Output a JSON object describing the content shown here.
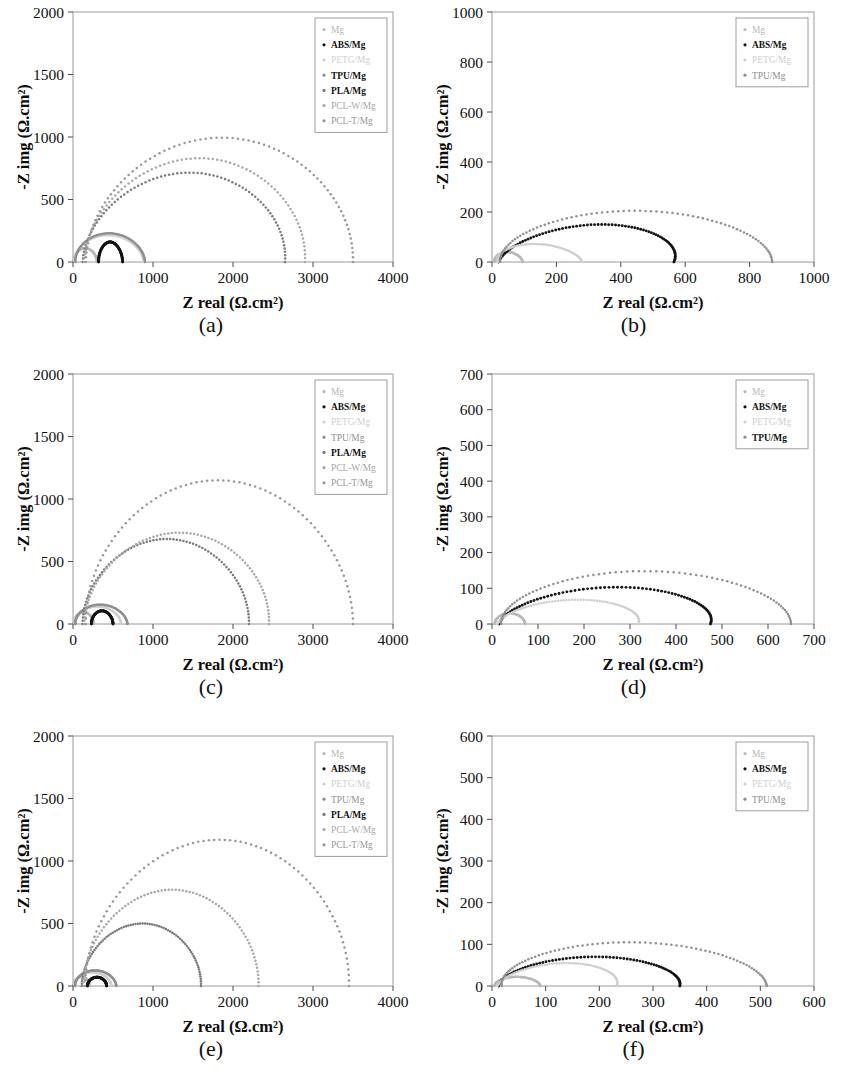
{
  "figure": {
    "axis_titles": {
      "x": "Z real (Ω.cm²)",
      "y": "-Z img (Ω.cm²)"
    },
    "series_colors": {
      "Mg": "#b9b9b9",
      "ABS/Mg": "#141414",
      "PETG/Mg": "#cfcfcf",
      "TPU/Mg": "#8f8f8f",
      "PLA/Mg": "#7a7a7a",
      "PCL-W/Mg": "#a8a8a8",
      "PCL-T/Mg": "#989898"
    }
  },
  "panels": [
    {
      "id": "a",
      "caption": "(a)",
      "legend": [
        "Mg",
        "ABS/Mg",
        "PETG/Mg",
        "TPU/Mg",
        "PLA/Mg",
        "PCL-W/Mg",
        "PCL-T/Mg"
      ],
      "legend_bold": [
        "ABS/Mg",
        "TPU/Mg",
        "PLA/Mg"
      ],
      "xticks": [
        0,
        1000,
        2000,
        3000,
        4000
      ],
      "yticks": [
        0,
        500,
        1000,
        1500,
        2000
      ]
    },
    {
      "id": "b",
      "caption": "(b)",
      "legend": [
        "Mg",
        "ABS/Mg",
        "PETG/Mg",
        "TPU/Mg"
      ],
      "legend_bold": [
        "ABS/Mg"
      ],
      "xticks": [
        0,
        200,
        400,
        600,
        800,
        1000
      ],
      "yticks": [
        0,
        200,
        400,
        600,
        800,
        1000
      ]
    },
    {
      "id": "c",
      "caption": "(c)",
      "legend": [
        "Mg",
        "ABS/Mg",
        "PETG/Mg",
        "TPU/Mg",
        "PLA/Mg",
        "PCL-W/Mg",
        "PCL-T/Mg"
      ],
      "legend_bold": [
        "ABS/Mg",
        "PLA/Mg"
      ],
      "xticks": [
        0,
        1000,
        2000,
        3000,
        4000
      ],
      "yticks": [
        0,
        500,
        1000,
        1500,
        2000
      ]
    },
    {
      "id": "d",
      "caption": "(d)",
      "legend": [
        "Mg",
        "ABS/Mg",
        "PETG/Mg",
        "TPU/Mg"
      ],
      "legend_bold": [
        "ABS/Mg",
        "TPU/Mg"
      ],
      "xticks": [
        0,
        100,
        200,
        300,
        400,
        500,
        600,
        700
      ],
      "yticks": [
        0,
        100,
        200,
        300,
        400,
        500,
        600,
        700
      ]
    },
    {
      "id": "e",
      "caption": "(e)",
      "legend": [
        "Mg",
        "ABS/Mg",
        "PETG/Mg",
        "TPU/Mg",
        "PLA/Mg",
        "PCL-W/Mg",
        "PCL-T/Mg"
      ],
      "legend_bold": [
        "ABS/Mg",
        "PLA/Mg"
      ],
      "xticks": [
        0,
        1000,
        2000,
        3000,
        4000
      ],
      "yticks": [
        0,
        500,
        1000,
        1500,
        2000
      ]
    },
    {
      "id": "f",
      "caption": "(f)",
      "legend": [
        "Mg",
        "ABS/Mg",
        "PETG/Mg",
        "TPU/Mg"
      ],
      "legend_bold": [
        "ABS/Mg"
      ],
      "xticks": [
        0,
        100,
        200,
        300,
        400,
        500,
        600
      ],
      "yticks": [
        0,
        100,
        200,
        300,
        400,
        500,
        600
      ]
    }
  ],
  "chart_data": [
    {
      "type": "scatter",
      "panel": "a",
      "title": "(a)",
      "xlabel": "Z real (Ω.cm²)",
      "ylabel": "-Z img (Ω.cm²)",
      "xlim": [
        0,
        4000
      ],
      "ylim": [
        0,
        2000
      ],
      "grid": false,
      "legend_position": "top-right",
      "series": [
        {
          "name": "Mg",
          "color": "#b9b9b9",
          "arc": {
            "x_start": 10,
            "x_end": 300,
            "peak_y": 110,
            "peak_x": 150
          }
        },
        {
          "name": "ABS/Mg",
          "color": "#141414",
          "arc": {
            "x_start": 320,
            "x_end": 620,
            "peak_y": 160,
            "peak_x": 460
          }
        },
        {
          "name": "PETG/Mg",
          "color": "#cfcfcf",
          "arc": {
            "x_start": 20,
            "x_end": 880,
            "peak_y": 215,
            "peak_x": 430
          }
        },
        {
          "name": "TPU/Mg",
          "color": "#8f8f8f",
          "arc": {
            "x_start": 30,
            "x_end": 900,
            "peak_y": 230,
            "peak_x": 440
          }
        },
        {
          "name": "PLA/Mg",
          "color": "#7a7a7a",
          "arc": {
            "x_start": 120,
            "x_end": 2650,
            "peak_y": 715,
            "peak_x": 1500
          }
        },
        {
          "name": "PCL-W/Mg",
          "color": "#a8a8a8",
          "arc": {
            "x_start": 140,
            "x_end": 2900,
            "peak_y": 830,
            "peak_x": 1620
          }
        },
        {
          "name": "PCL-T/Mg",
          "color": "#989898",
          "arc": {
            "x_start": 160,
            "x_end": 3500,
            "peak_y": 995,
            "peak_x": 1880
          }
        }
      ]
    },
    {
      "type": "scatter",
      "panel": "b",
      "title": "(b)",
      "xlabel": "Z real (Ω.cm²)",
      "ylabel": "-Z img (Ω.cm²)",
      "xlim": [
        0,
        1000
      ],
      "ylim": [
        0,
        1000
      ],
      "grid": false,
      "legend_position": "top-right",
      "series": [
        {
          "name": "Mg",
          "color": "#b9b9b9",
          "arc": {
            "x_start": 8,
            "x_end": 95,
            "peak_y": 40,
            "peak_x": 45
          }
        },
        {
          "name": "ABS/Mg",
          "color": "#141414",
          "arc": {
            "x_start": 20,
            "x_end": 565,
            "peak_y": 150,
            "peak_x": 370
          }
        },
        {
          "name": "PETG/Mg",
          "color": "#cfcfcf",
          "arc": {
            "x_start": 18,
            "x_end": 280,
            "peak_y": 72,
            "peak_x": 120
          }
        },
        {
          "name": "TPU/Mg",
          "color": "#8f8f8f",
          "arc": {
            "x_start": 25,
            "x_end": 870,
            "peak_y": 205,
            "peak_x": 440
          }
        }
      ]
    },
    {
      "type": "scatter",
      "panel": "c",
      "title": "(c)",
      "xlabel": "Z real (Ω.cm²)",
      "ylabel": "-Z img (Ω.cm²)",
      "xlim": [
        0,
        4000
      ],
      "ylim": [
        0,
        2000
      ],
      "grid": false,
      "legend_position": "top-right",
      "series": [
        {
          "name": "Mg",
          "color": "#b9b9b9",
          "arc": {
            "x_start": 10,
            "x_end": 260,
            "peak_y": 95,
            "peak_x": 130
          }
        },
        {
          "name": "ABS/Mg",
          "color": "#141414",
          "arc": {
            "x_start": 230,
            "x_end": 500,
            "peak_y": 105,
            "peak_x": 360
          }
        },
        {
          "name": "PETG/Mg",
          "color": "#cfcfcf",
          "arc": {
            "x_start": 20,
            "x_end": 600,
            "peak_y": 140,
            "peak_x": 300
          }
        },
        {
          "name": "TPU/Mg",
          "color": "#8f8f8f",
          "arc": {
            "x_start": 30,
            "x_end": 680,
            "peak_y": 155,
            "peak_x": 330
          }
        },
        {
          "name": "PLA/Mg",
          "color": "#7a7a7a",
          "arc": {
            "x_start": 120,
            "x_end": 2200,
            "peak_y": 680,
            "peak_x": 1180
          }
        },
        {
          "name": "PCL-W/Mg",
          "color": "#a8a8a8",
          "arc": {
            "x_start": 140,
            "x_end": 2450,
            "peak_y": 730,
            "peak_x": 1350
          }
        },
        {
          "name": "PCL-T/Mg",
          "color": "#989898",
          "arc": {
            "x_start": 160,
            "x_end": 3500,
            "peak_y": 1150,
            "peak_x": 1800
          }
        }
      ]
    },
    {
      "type": "scatter",
      "panel": "d",
      "title": "(d)",
      "xlabel": "Z real (Ω.cm²)",
      "ylabel": "-Z img (Ω.cm²)",
      "xlim": [
        0,
        700
      ],
      "ylim": [
        0,
        700
      ],
      "grid": false,
      "legend_position": "top-right",
      "series": [
        {
          "name": "Mg",
          "color": "#b9b9b9",
          "arc": {
            "x_start": 6,
            "x_end": 72,
            "peak_y": 30,
            "peak_x": 38
          }
        },
        {
          "name": "ABS/Mg",
          "color": "#141414",
          "arc": {
            "x_start": 15,
            "x_end": 475,
            "peak_y": 103,
            "peak_x": 290
          }
        },
        {
          "name": "PETG/Mg",
          "color": "#cfcfcf",
          "arc": {
            "x_start": 12,
            "x_end": 318,
            "peak_y": 68,
            "peak_x": 200
          }
        },
        {
          "name": "TPU/Mg",
          "color": "#8f8f8f",
          "arc": {
            "x_start": 20,
            "x_end": 650,
            "peak_y": 148,
            "peak_x": 330
          }
        }
      ]
    },
    {
      "type": "scatter",
      "panel": "e",
      "title": "(e)",
      "xlabel": "Z real (Ω.cm²)",
      "ylabel": "-Z img (Ω.cm²)",
      "xlim": [
        0,
        4000
      ],
      "ylim": [
        0,
        2000
      ],
      "grid": false,
      "legend_position": "top-right",
      "series": [
        {
          "name": "Mg",
          "color": "#b9b9b9",
          "arc": {
            "x_start": 8,
            "x_end": 210,
            "peak_y": 75,
            "peak_x": 105
          }
        },
        {
          "name": "ABS/Mg",
          "color": "#141414",
          "arc": {
            "x_start": 180,
            "x_end": 420,
            "peak_y": 70,
            "peak_x": 300
          }
        },
        {
          "name": "PETG/Mg",
          "color": "#cfcfcf",
          "arc": {
            "x_start": 15,
            "x_end": 480,
            "peak_y": 110,
            "peak_x": 240
          }
        },
        {
          "name": "TPU/Mg",
          "color": "#8f8f8f",
          "arc": {
            "x_start": 25,
            "x_end": 540,
            "peak_y": 125,
            "peak_x": 270
          }
        },
        {
          "name": "PLA/Mg",
          "color": "#7a7a7a",
          "arc": {
            "x_start": 110,
            "x_end": 1600,
            "peak_y": 500,
            "peak_x": 880
          }
        },
        {
          "name": "PCL-W/Mg",
          "color": "#a8a8a8",
          "arc": {
            "x_start": 130,
            "x_end": 2320,
            "peak_y": 770,
            "peak_x": 1250
          }
        },
        {
          "name": "PCL-T/Mg",
          "color": "#989898",
          "arc": {
            "x_start": 150,
            "x_end": 3450,
            "peak_y": 1170,
            "peak_x": 1850
          }
        }
      ]
    },
    {
      "type": "scatter",
      "panel": "f",
      "title": "(f)",
      "xlabel": "Z real (Ω.cm²)",
      "ylabel": "-Z img (Ω.cm²)",
      "xlim": [
        0,
        600
      ],
      "ylim": [
        0,
        600
      ],
      "grid": false,
      "legend_position": "top-right",
      "series": [
        {
          "name": "Mg",
          "color": "#b9b9b9",
          "arc": {
            "x_start": 5,
            "x_end": 90,
            "peak_y": 22,
            "peak_x": 45
          }
        },
        {
          "name": "ABS/Mg",
          "color": "#141414",
          "arc": {
            "x_start": 12,
            "x_end": 350,
            "peak_y": 70,
            "peak_x": 200
          }
        },
        {
          "name": "PETG/Mg",
          "color": "#cfcfcf",
          "arc": {
            "x_start": 10,
            "x_end": 232,
            "peak_y": 55,
            "peak_x": 150
          }
        },
        {
          "name": "TPU/Mg",
          "color": "#8f8f8f",
          "arc": {
            "x_start": 18,
            "x_end": 512,
            "peak_y": 105,
            "peak_x": 250
          }
        }
      ]
    }
  ]
}
